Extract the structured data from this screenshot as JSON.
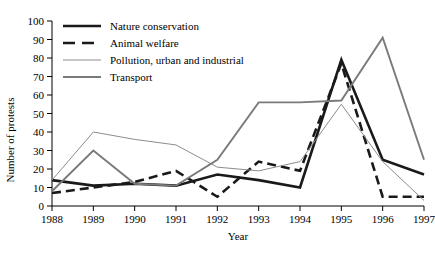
{
  "chart_data": {
    "type": "line",
    "title": "",
    "xlabel": "Year",
    "ylabel": "Number of protests",
    "categories": [
      "1988",
      "1989",
      "1990",
      "1991",
      "1992",
      "1993",
      "1994",
      "1995",
      "1996",
      "1997"
    ],
    "x": [
      1988,
      1989,
      1990,
      1991,
      1992,
      1993,
      1994,
      1995,
      1996,
      1997
    ],
    "xlim": [
      1988,
      1997
    ],
    "ylim": [
      0,
      100
    ],
    "yticks": [
      0,
      10,
      20,
      30,
      40,
      50,
      60,
      70,
      80,
      90,
      100
    ],
    "grid": false,
    "legend_position": "top-left-inside",
    "series": [
      {
        "name": "Nature conservation",
        "style": "solid-thick-black",
        "color": "#1a1a1a",
        "values": [
          14,
          11,
          12,
          11,
          17,
          14,
          10,
          79,
          25,
          17
        ]
      },
      {
        "name": "Animal welfare",
        "style": "dashed-thick-black",
        "color": "#1a1a1a",
        "values": [
          7,
          10,
          13,
          19,
          5,
          24,
          19,
          77,
          5,
          5
        ]
      },
      {
        "name": "Pollution, urban and industrial",
        "style": "solid-thin-gray",
        "color": "#8c8c8c",
        "values": [
          14,
          40,
          36,
          33,
          21,
          19,
          24,
          55,
          24,
          3
        ]
      },
      {
        "name": "Transport",
        "style": "solid-medium-gray",
        "color": "#7a7a7a",
        "values": [
          8,
          30,
          12,
          11,
          25,
          56,
          56,
          57,
          91,
          25
        ]
      }
    ]
  },
  "legend": {
    "items": [
      {
        "label": "Nature conservation"
      },
      {
        "label": "Animal welfare"
      },
      {
        "label": "Pollution, urban and industrial"
      },
      {
        "label": "Transport"
      }
    ]
  },
  "axes": {
    "y_title": "Number of protests",
    "x_title": "Year",
    "y_tick_labels": [
      "100",
      "90",
      "80",
      "70",
      "60",
      "50",
      "40",
      "30",
      "20",
      "10",
      "0"
    ],
    "x_tick_labels": [
      "1988",
      "1989",
      "1990",
      "1991",
      "1992",
      "1993",
      "1994",
      "1995",
      "1996",
      "1997"
    ]
  }
}
